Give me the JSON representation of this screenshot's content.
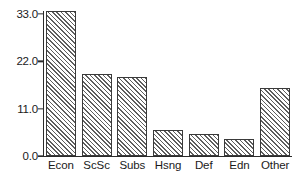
{
  "chart_data": {
    "type": "bar",
    "title": "",
    "xlabel": "",
    "ylabel": "",
    "categories": [
      "Econ",
      "ScSc",
      "Subs",
      "Hsng",
      "Def",
      "Edn",
      "Other"
    ],
    "values": [
      33.7,
      19.0,
      18.3,
      6.0,
      5.1,
      4.0,
      15.8
    ],
    "ylim": [
      0.0,
      36.0
    ],
    "yticks": [
      0.0,
      11.0,
      22.0,
      33.0
    ],
    "ytick_labels": [
      "0.0",
      "11.0",
      "22.0",
      "33.0"
    ],
    "grid": false,
    "legend": null,
    "bar_fill": "hatched-diagonal",
    "bar_edge_color": "#3a3a3a",
    "axis_color": "#2b2b2b",
    "background": "#ffffff"
  }
}
